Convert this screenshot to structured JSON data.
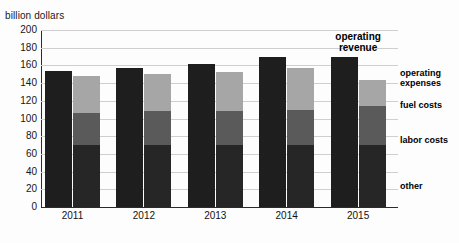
{
  "chart_data": {
    "type": "bar",
    "title": "",
    "subtitle": "",
    "ylabel": "billion dollars",
    "xlabel": "",
    "categories": [
      "2011",
      "2012",
      "2013",
      "2014",
      "2015"
    ],
    "ylim": [
      0,
      200
    ],
    "ytick_step": 20,
    "yticks": [
      "200",
      "180",
      "160",
      "140",
      "120",
      "100",
      "80",
      "60",
      "40",
      "20",
      "0"
    ],
    "grid": true,
    "legend_position": "right",
    "series": [
      {
        "name": "operating revenue",
        "color": "#1e1e1e",
        "stacked": false,
        "values": [
          154,
          157,
          162,
          169,
          169
        ]
      },
      {
        "name": "fuel costs",
        "color": "#a6a6a6",
        "stacked": true,
        "stack": "operating expenses",
        "values": [
          42,
          42,
          44,
          47,
          30
        ]
      },
      {
        "name": "labor costs",
        "color": "#5a5a5a",
        "stacked": true,
        "stack": "operating expenses",
        "values": [
          36,
          38,
          38,
          40,
          44
        ]
      },
      {
        "name": "other",
        "color": "#262626",
        "stacked": true,
        "stack": "operating expenses",
        "values": [
          70,
          70,
          70,
          70,
          70
        ]
      }
    ],
    "stack_totals": {
      "name": "operating expenses",
      "values": [
        148,
        150,
        152,
        157,
        144
      ]
    },
    "annotations": [
      {
        "text_line1": "operating",
        "text_line2": "revenue",
        "target_category": "2015",
        "target_series": "operating revenue"
      }
    ],
    "legend": [
      {
        "label_line1": "operating",
        "label_line2": "expenses",
        "swatch": "#a6a6a6"
      },
      {
        "label_line1": "fuel costs",
        "label_line2": "",
        "swatch": "#a6a6a6"
      },
      {
        "label_line1": "labor costs",
        "label_line2": "",
        "swatch": "#5a5a5a"
      },
      {
        "label_line1": "other",
        "label_line2": "",
        "swatch": "#262626"
      }
    ]
  },
  "axis": {
    "y_title": "billion dollars"
  },
  "ticks": {
    "y": [
      "200",
      "180",
      "160",
      "140",
      "120",
      "100",
      "80",
      "60",
      "40",
      "20",
      "0"
    ],
    "x": [
      "2011",
      "2012",
      "2013",
      "2014",
      "2015"
    ]
  },
  "callout": {
    "line1": "operating",
    "line2": "revenue"
  },
  "legend": {
    "operating_expenses_l1": "operating",
    "operating_expenses_l2": "expenses",
    "fuel_costs": "fuel costs",
    "labor_costs": "labor costs",
    "other": "other"
  }
}
